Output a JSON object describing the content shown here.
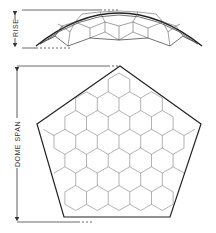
{
  "diagram": {
    "type": "geodesic-dome-drawing",
    "views": [
      {
        "name": "elevation",
        "label": "RISE"
      },
      {
        "name": "plan",
        "label": "DOME SPAN"
      }
    ]
  },
  "labels": {
    "rise": "RISE",
    "dome_span": "DOME SPAN"
  },
  "colors": {
    "line": "#333333",
    "background": "#ffffff"
  }
}
